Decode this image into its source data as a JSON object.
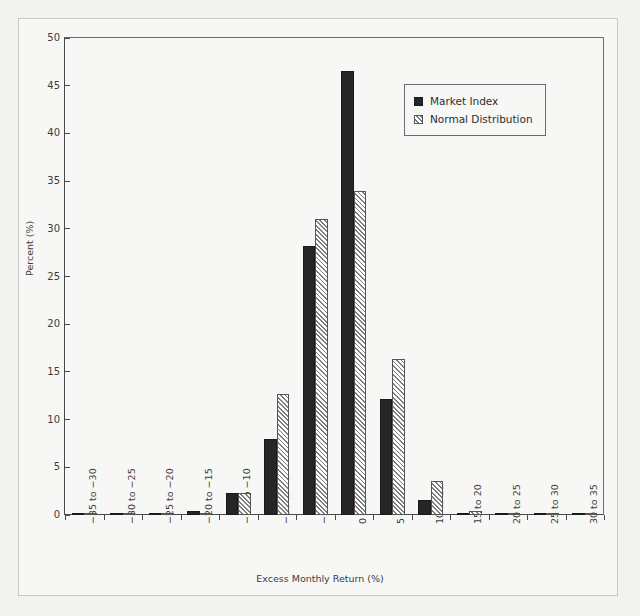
{
  "figure": {
    "background_color": "#f2f2f0",
    "panel_color": "#f7f7f5",
    "axis_color": "#4a4a4a"
  },
  "chart_data": {
    "type": "bar",
    "title": "",
    "xlabel": "Excess Monthly Return (%)",
    "ylabel": "Percent (%)",
    "ylim": [
      0,
      50
    ],
    "ytick_values": [
      0,
      5,
      10,
      15,
      20,
      25,
      30,
      35,
      40,
      45,
      50
    ],
    "ytick_labels": [
      "0",
      "5",
      "10",
      "15",
      "20",
      "25",
      "30",
      "35",
      "40",
      "45",
      "50"
    ],
    "grid": false,
    "legend_position": "upper right",
    "categories": [
      "−35 to −30",
      "−30 to −25",
      "−25 to −20",
      "−20 to −15",
      "−15 to −10",
      "−10 to −5",
      "−5 to 0",
      "0 to 5",
      "5 to 10",
      "10 to 15",
      "15 to 20",
      "20 to 25",
      "25 to 30",
      "30 to 35"
    ],
    "series": [
      {
        "name": "Market Index",
        "color": "#262626",
        "fill": "solid",
        "values": [
          0.1,
          0.2,
          0.2,
          0.4,
          2.3,
          8.0,
          28.2,
          46.5,
          12.2,
          1.6,
          0.2,
          0.1,
          0.2,
          0.2
        ]
      },
      {
        "name": "Normal Distribution",
        "color": "#ffffff",
        "fill": "hatched",
        "values": [
          0.05,
          0.1,
          0.1,
          0.2,
          2.3,
          12.7,
          31.0,
          34.0,
          16.4,
          3.6,
          0.4,
          0.1,
          0.1,
          0.1
        ]
      }
    ]
  }
}
